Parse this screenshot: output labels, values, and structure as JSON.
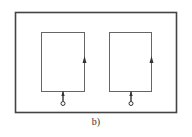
{
  "figure": {
    "caption": "b)",
    "stroke_color": "#555555",
    "background": "#ffffff",
    "outer_frame": {
      "x": 15,
      "y": 12,
      "w": 161,
      "h": 100
    },
    "loops": [
      {
        "id": "left",
        "x": 41,
        "y": 32,
        "w": 43,
        "h": 59,
        "arrow_x": 84,
        "arrow_y": 61,
        "terminal_x": 63,
        "terminal_y": 104
      },
      {
        "id": "right",
        "x": 109,
        "y": 32,
        "w": 42,
        "h": 59,
        "arrow_x": 151,
        "arrow_y": 61,
        "terminal_x": 131,
        "terminal_y": 104
      }
    ]
  }
}
